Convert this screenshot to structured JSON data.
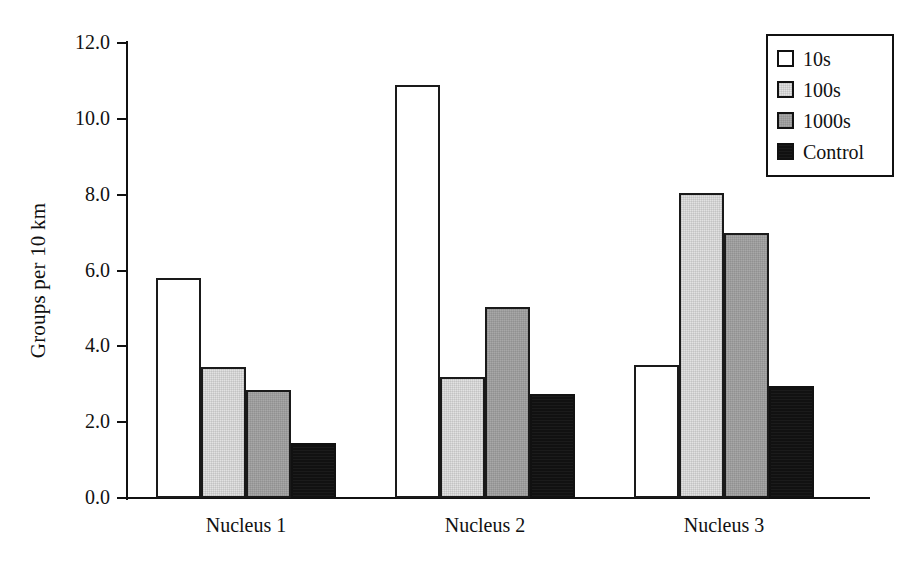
{
  "chart_data": {
    "type": "bar",
    "title": "",
    "xlabel": "",
    "ylabel": "Groups per 10 km",
    "categories": [
      "Nucleus 1",
      "Nucleus 2",
      "Nucleus 3"
    ],
    "series": [
      {
        "name": "10s",
        "color": "#ffffff",
        "values": [
          5.8,
          10.9,
          3.5
        ]
      },
      {
        "name": "100s",
        "color": "#e2e2e2",
        "values": [
          3.45,
          3.2,
          8.05
        ]
      },
      {
        "name": "1000s",
        "color": "#a8a8a8",
        "values": [
          2.85,
          5.05,
          7.0
        ]
      },
      {
        "name": "Control",
        "color": "#111111",
        "values": [
          1.45,
          2.75,
          2.95
        ]
      }
    ],
    "ylim": [
      0.0,
      12.0
    ],
    "y_ticks": [
      0.0,
      2.0,
      4.0,
      6.0,
      8.0,
      10.0,
      12.0
    ],
    "y_tick_labels": [
      "0.0",
      "2.0",
      "4.0",
      "6.0",
      "8.0",
      "10.0",
      "12.0"
    ],
    "grid": false,
    "legend_position": "top-right"
  },
  "legend": {
    "entries": [
      {
        "label": "10s"
      },
      {
        "label": "100s"
      },
      {
        "label": "1000s"
      },
      {
        "label": "Control"
      }
    ]
  },
  "axes": {
    "y_title": "Groups per 10 km"
  }
}
